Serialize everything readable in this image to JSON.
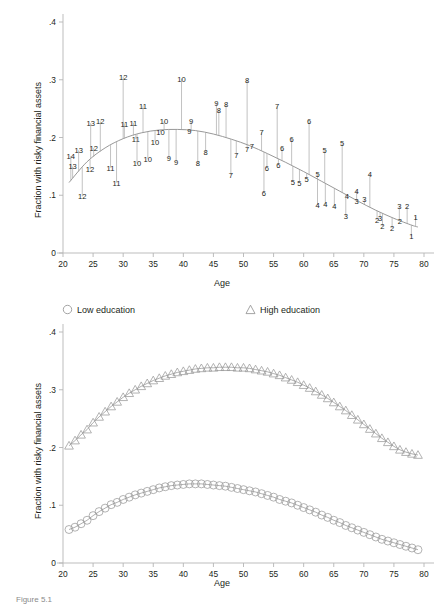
{
  "figure": {
    "caption": "Figure 5.1",
    "axis_label_y": "Fraction with risky financial assets",
    "axis_label_x": "Age",
    "y_ticks": [
      "0",
      ".1",
      ".2",
      ".3",
      ".4"
    ],
    "x_ticks": [
      "20",
      "25",
      "30",
      "35",
      "40",
      "45",
      "50",
      "55",
      "60",
      "65",
      "70",
      "75",
      "80"
    ],
    "colors": {
      "axis": "#b5b5b5",
      "text": "#231f20",
      "curve": "#8c8c8c",
      "spike": "#a0a0a0",
      "marker": "#9a9a9a"
    }
  },
  "legend": {
    "items": [
      {
        "label": "Low education",
        "marker": "circle"
      },
      {
        "label": "High education",
        "marker": "triangle"
      }
    ]
  },
  "chart_data": [
    {
      "type": "scatter",
      "title": "",
      "xlabel": "Age",
      "ylabel": "Fraction with risky financial assets",
      "xlim": [
        20,
        80
      ],
      "ylim": [
        0,
        0.4
      ],
      "grid": false,
      "legend_position": "none",
      "notes": "Labelled point plot: each data point is drawn as its cohort number with a spike line connecting it to the fitted quadratic age profile.",
      "fitted_curve": {
        "name": "Fitted age profile",
        "x": [
          21,
          24,
          27,
          30,
          33,
          36,
          39,
          42,
          45,
          48,
          51,
          54,
          57,
          60,
          63,
          66,
          69,
          72,
          75,
          78,
          79
        ],
        "y": [
          0.122,
          0.158,
          0.182,
          0.198,
          0.208,
          0.213,
          0.214,
          0.212,
          0.206,
          0.197,
          0.186,
          0.172,
          0.157,
          0.141,
          0.124,
          0.107,
          0.09,
          0.074,
          0.06,
          0.048,
          0.045
        ]
      },
      "points": [
        {
          "label": "14",
          "x": 21.3,
          "y": 0.168
        },
        {
          "label": "13",
          "x": 21.6,
          "y": 0.15
        },
        {
          "label": "13",
          "x": 22.6,
          "y": 0.178
        },
        {
          "label": "13",
          "x": 24.6,
          "y": 0.225
        },
        {
          "label": "12",
          "x": 23.2,
          "y": 0.098
        },
        {
          "label": "12",
          "x": 24.5,
          "y": 0.145
        },
        {
          "label": "12",
          "x": 25.1,
          "y": 0.182
        },
        {
          "label": "12",
          "x": 26.2,
          "y": 0.228
        },
        {
          "label": "12",
          "x": 30.0,
          "y": 0.305
        },
        {
          "label": "11",
          "x": 27.9,
          "y": 0.148
        },
        {
          "label": "11",
          "x": 28.9,
          "y": 0.122
        },
        {
          "label": "11",
          "x": 30.2,
          "y": 0.224
        },
        {
          "label": "11",
          "x": 31.7,
          "y": 0.225
        },
        {
          "label": "11",
          "x": 33.3,
          "y": 0.255
        },
        {
          "label": "11",
          "x": 32.1,
          "y": 0.197
        },
        {
          "label": "10",
          "x": 32.3,
          "y": 0.155
        },
        {
          "label": "10",
          "x": 34.1,
          "y": 0.163
        },
        {
          "label": "10",
          "x": 35.3,
          "y": 0.193
        },
        {
          "label": "10",
          "x": 36.2,
          "y": 0.21
        },
        {
          "label": "10",
          "x": 36.8,
          "y": 0.228
        },
        {
          "label": "10",
          "x": 39.7,
          "y": 0.302
        },
        {
          "label": "9",
          "x": 37.6,
          "y": 0.164
        },
        {
          "label": "9",
          "x": 38.8,
          "y": 0.158
        },
        {
          "label": "9",
          "x": 41.0,
          "y": 0.211
        },
        {
          "label": "9",
          "x": 41.3,
          "y": 0.228
        },
        {
          "label": "9",
          "x": 45.5,
          "y": 0.26
        },
        {
          "label": "8",
          "x": 42.4,
          "y": 0.155
        },
        {
          "label": "8",
          "x": 43.7,
          "y": 0.175
        },
        {
          "label": "8",
          "x": 45.9,
          "y": 0.248
        },
        {
          "label": "8",
          "x": 47.1,
          "y": 0.258
        },
        {
          "label": "8",
          "x": 50.6,
          "y": 0.3
        },
        {
          "label": "7",
          "x": 47.9,
          "y": 0.135
        },
        {
          "label": "7",
          "x": 48.8,
          "y": 0.17
        },
        {
          "label": "7",
          "x": 50.6,
          "y": 0.18
        },
        {
          "label": "7",
          "x": 51.4,
          "y": 0.186
        },
        {
          "label": "7",
          "x": 53.0,
          "y": 0.21
        },
        {
          "label": "7",
          "x": 55.6,
          "y": 0.255
        },
        {
          "label": "6",
          "x": 53.4,
          "y": 0.104
        },
        {
          "label": "6",
          "x": 53.9,
          "y": 0.148
        },
        {
          "label": "6",
          "x": 55.8,
          "y": 0.152
        },
        {
          "label": "6",
          "x": 56.4,
          "y": 0.182
        },
        {
          "label": "6",
          "x": 58.0,
          "y": 0.198
        },
        {
          "label": "6",
          "x": 60.9,
          "y": 0.228
        },
        {
          "label": "5",
          "x": 58.2,
          "y": 0.123
        },
        {
          "label": "5",
          "x": 59.3,
          "y": 0.122
        },
        {
          "label": "5",
          "x": 60.5,
          "y": 0.128
        },
        {
          "label": "5",
          "x": 62.3,
          "y": 0.137
        },
        {
          "label": "5",
          "x": 63.5,
          "y": 0.178
        },
        {
          "label": "5",
          "x": 66.4,
          "y": 0.19
        },
        {
          "label": "4",
          "x": 62.3,
          "y": 0.083
        },
        {
          "label": "4",
          "x": 63.6,
          "y": 0.084
        },
        {
          "label": "4",
          "x": 65.1,
          "y": 0.081
        },
        {
          "label": "4",
          "x": 67.2,
          "y": 0.098
        },
        {
          "label": "4",
          "x": 68.8,
          "y": 0.108
        },
        {
          "label": "4",
          "x": 71.0,
          "y": 0.136
        },
        {
          "label": "3",
          "x": 67.0,
          "y": 0.064
        },
        {
          "label": "3",
          "x": 68.8,
          "y": 0.09
        },
        {
          "label": "3",
          "x": 70.1,
          "y": 0.094
        },
        {
          "label": "3",
          "x": 72.7,
          "y": 0.061
        },
        {
          "label": "3",
          "x": 75.9,
          "y": 0.082
        },
        {
          "label": "2",
          "x": 72.2,
          "y": 0.058
        },
        {
          "label": "2",
          "x": 73.1,
          "y": 0.046
        },
        {
          "label": "2",
          "x": 74.7,
          "y": 0.043
        },
        {
          "label": "2",
          "x": 77.2,
          "y": 0.081
        },
        {
          "label": "2",
          "x": 76.0,
          "y": 0.055
        },
        {
          "label": "1",
          "x": 78.6,
          "y": 0.063
        },
        {
          "label": "1",
          "x": 77.9,
          "y": 0.029
        }
      ]
    },
    {
      "type": "scatter",
      "title": "",
      "xlabel": "Age",
      "ylabel": "Fraction with risky financial assets",
      "xlim": [
        20,
        80
      ],
      "ylim": [
        0,
        0.4
      ],
      "grid": false,
      "legend_position": "top",
      "series": [
        {
          "name": "Low education",
          "marker": "circle",
          "x": [
            21,
            22,
            23,
            24,
            25,
            26,
            27,
            28,
            29,
            30,
            31,
            32,
            33,
            34,
            35,
            36,
            37,
            38,
            39,
            40,
            41,
            42,
            43,
            44,
            45,
            46,
            47,
            48,
            49,
            50,
            51,
            52,
            53,
            54,
            55,
            56,
            57,
            58,
            59,
            60,
            61,
            62,
            63,
            64,
            65,
            66,
            67,
            68,
            69,
            70,
            71,
            72,
            73,
            74,
            75,
            76,
            77,
            78,
            79
          ],
          "values": [
            0.058,
            0.062,
            0.068,
            0.074,
            0.082,
            0.089,
            0.095,
            0.101,
            0.105,
            0.11,
            0.114,
            0.118,
            0.121,
            0.124,
            0.127,
            0.13,
            0.132,
            0.134,
            0.135,
            0.136,
            0.137,
            0.137,
            0.137,
            0.136,
            0.135,
            0.134,
            0.133,
            0.131,
            0.129,
            0.127,
            0.125,
            0.123,
            0.12,
            0.117,
            0.114,
            0.11,
            0.107,
            0.104,
            0.1,
            0.096,
            0.092,
            0.088,
            0.083,
            0.079,
            0.074,
            0.07,
            0.065,
            0.061,
            0.057,
            0.053,
            0.049,
            0.045,
            0.041,
            0.038,
            0.035,
            0.032,
            0.029,
            0.026,
            0.023
          ]
        },
        {
          "name": "High education",
          "marker": "triangle",
          "x": [
            21,
            22,
            23,
            24,
            25,
            26,
            27,
            28,
            29,
            30,
            31,
            32,
            33,
            34,
            35,
            36,
            37,
            38,
            39,
            40,
            41,
            42,
            43,
            44,
            45,
            46,
            47,
            48,
            49,
            50,
            51,
            52,
            53,
            54,
            55,
            56,
            57,
            58,
            59,
            60,
            61,
            62,
            63,
            64,
            65,
            66,
            67,
            68,
            69,
            70,
            71,
            72,
            73,
            74,
            75,
            76,
            77,
            78,
            79
          ],
          "values": [
            0.203,
            0.212,
            0.222,
            0.231,
            0.243,
            0.253,
            0.262,
            0.271,
            0.279,
            0.287,
            0.294,
            0.3,
            0.306,
            0.311,
            0.316,
            0.32,
            0.324,
            0.327,
            0.33,
            0.332,
            0.334,
            0.336,
            0.337,
            0.338,
            0.338,
            0.339,
            0.339,
            0.339,
            0.338,
            0.338,
            0.337,
            0.335,
            0.333,
            0.331,
            0.328,
            0.325,
            0.321,
            0.317,
            0.313,
            0.308,
            0.303,
            0.297,
            0.291,
            0.285,
            0.278,
            0.271,
            0.264,
            0.256,
            0.248,
            0.24,
            0.232,
            0.224,
            0.216,
            0.209,
            0.202,
            0.196,
            0.192,
            0.189,
            0.187
          ]
        }
      ]
    }
  ]
}
